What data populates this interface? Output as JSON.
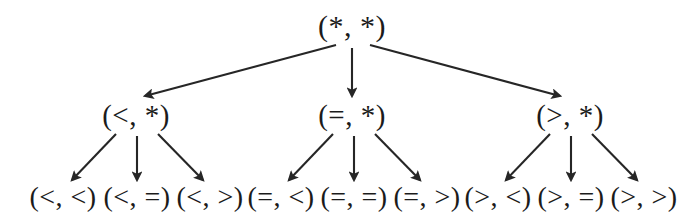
{
  "diagram": {
    "title": "",
    "type": "ternary-tree",
    "stroke_color": "#262626",
    "text_color": "#1b1b1b",
    "background_color": "#ffffff",
    "levels": 3,
    "root": {
      "id": "root",
      "label": "(*, *)",
      "x": 352,
      "y": 26
    },
    "middle": [
      {
        "id": "mid-lt",
        "label": "(<, *)",
        "x": 136,
        "y": 115
      },
      {
        "id": "mid-eq",
        "label": "(=, *)",
        "x": 352,
        "y": 115
      },
      {
        "id": "mid-gt",
        "label": "(>, *)",
        "x": 570,
        "y": 115
      }
    ],
    "leaves": [
      {
        "id": "leaf-lt-lt",
        "label": "(<, <)",
        "x": 63,
        "y": 197,
        "parent": "mid-lt"
      },
      {
        "id": "leaf-lt-eq",
        "label": "(<, =)",
        "x": 137,
        "y": 197,
        "parent": "mid-lt"
      },
      {
        "id": "leaf-lt-gt",
        "label": "(<, >)",
        "x": 210,
        "y": 197,
        "parent": "mid-lt"
      },
      {
        "id": "leaf-eq-lt",
        "label": "(=, <)",
        "x": 281,
        "y": 197,
        "parent": "mid-eq"
      },
      {
        "id": "leaf-eq-eq",
        "label": "(=, =)",
        "x": 354,
        "y": 197,
        "parent": "mid-eq"
      },
      {
        "id": "leaf-eq-gt",
        "label": "(=, >)",
        "x": 427,
        "y": 197,
        "parent": "mid-eq"
      },
      {
        "id": "leaf-gt-lt",
        "label": "(>, <)",
        "x": 498,
        "y": 197,
        "parent": "mid-gt"
      },
      {
        "id": "leaf-gt-eq",
        "label": "(>, =)",
        "x": 571,
        "y": 197,
        "parent": "mid-gt"
      },
      {
        "id": "leaf-gt-gt",
        "label": "(>, >)",
        "x": 644,
        "y": 197,
        "parent": "mid-gt"
      }
    ],
    "edges": [
      {
        "id": "edge-root-lt",
        "from": "root",
        "to": "mid-lt",
        "x1": 336,
        "y1": 45,
        "x2": 145,
        "y2": 96
      },
      {
        "id": "edge-root-eq",
        "from": "root",
        "to": "mid-eq",
        "x1": 352,
        "y1": 48,
        "x2": 352,
        "y2": 96
      },
      {
        "id": "edge-root-gt",
        "from": "root",
        "to": "mid-gt",
        "x1": 370,
        "y1": 45,
        "x2": 560,
        "y2": 96
      },
      {
        "id": "edge-lt-ltlt",
        "from": "mid-lt",
        "to": "leaf-lt-lt",
        "x1": 116,
        "y1": 134,
        "x2": 72,
        "y2": 180
      },
      {
        "id": "edge-lt-lteq",
        "from": "mid-lt",
        "to": "leaf-lt-eq",
        "x1": 137,
        "y1": 136,
        "x2": 137,
        "y2": 180
      },
      {
        "id": "edge-lt-ltgt",
        "from": "mid-lt",
        "to": "leaf-lt-gt",
        "x1": 158,
        "y1": 134,
        "x2": 203,
        "y2": 180
      },
      {
        "id": "edge-eq-eqlt",
        "from": "mid-eq",
        "to": "leaf-eq-lt",
        "x1": 333,
        "y1": 134,
        "x2": 289,
        "y2": 180
      },
      {
        "id": "edge-eq-eqeq",
        "from": "mid-eq",
        "to": "leaf-eq-eq",
        "x1": 354,
        "y1": 136,
        "x2": 354,
        "y2": 180
      },
      {
        "id": "edge-eq-eqgt",
        "from": "mid-eq",
        "to": "leaf-eq-gt",
        "x1": 375,
        "y1": 134,
        "x2": 420,
        "y2": 180
      },
      {
        "id": "edge-gt-gtlt",
        "from": "mid-gt",
        "to": "leaf-gt-lt",
        "x1": 550,
        "y1": 134,
        "x2": 506,
        "y2": 180
      },
      {
        "id": "edge-gt-gteq",
        "from": "mid-gt",
        "to": "leaf-gt-eq",
        "x1": 571,
        "y1": 136,
        "x2": 571,
        "y2": 180
      },
      {
        "id": "edge-gt-gtgt",
        "from": "mid-gt",
        "to": "leaf-gt-gt",
        "x1": 592,
        "y1": 134,
        "x2": 637,
        "y2": 180
      }
    ]
  }
}
